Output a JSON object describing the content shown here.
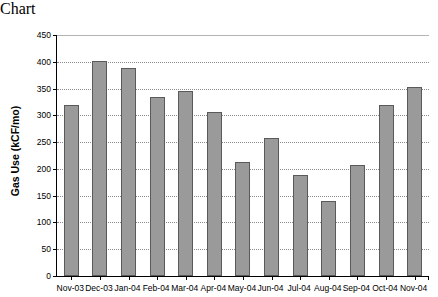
{
  "chart_data": {
    "type": "bar",
    "title": "",
    "xlabel": "",
    "ylabel": "Gas Use (kCF/mo)",
    "ylim": [
      0,
      450
    ],
    "yticks": [
      0,
      50,
      100,
      150,
      200,
      250,
      300,
      350,
      400,
      450
    ],
    "ytick_labels": [
      "0",
      "50",
      "100",
      "150",
      "200",
      "250",
      "300",
      "350",
      "400",
      "450"
    ],
    "grid": true,
    "legend": null,
    "bar_color": "#9a9a9a",
    "bar_edge_color": "#5a5a5a",
    "categories": [
      "Nov-03",
      "Dec-03",
      "Jan-04",
      "Feb-04",
      "Mar-04",
      "Apr-04",
      "May-04",
      "Jun-04",
      "Jul-04",
      "Aug-04",
      "Sep-04",
      "Oct-04",
      "Nov-04"
    ],
    "values": [
      320,
      402,
      388,
      335,
      345,
      306,
      212,
      257,
      188,
      141,
      207,
      320,
      353
    ],
    "points": [
      {
        "category": "Nov-03",
        "value": 320
      },
      {
        "category": "Dec-03",
        "value": 402
      },
      {
        "category": "Jan-04",
        "value": 388
      },
      {
        "category": "Feb-04",
        "value": 335
      },
      {
        "category": "Mar-04",
        "value": 345
      },
      {
        "category": "Apr-04",
        "value": 306
      },
      {
        "category": "May-04",
        "value": 212
      },
      {
        "category": "Jun-04",
        "value": 257
      },
      {
        "category": "Jul-04",
        "value": 188
      },
      {
        "category": "Aug-04",
        "value": 141
      },
      {
        "category": "Sep-04",
        "value": 207
      },
      {
        "category": "Oct-04",
        "value": 320
      },
      {
        "category": "Nov-04",
        "value": 353
      }
    ]
  }
}
